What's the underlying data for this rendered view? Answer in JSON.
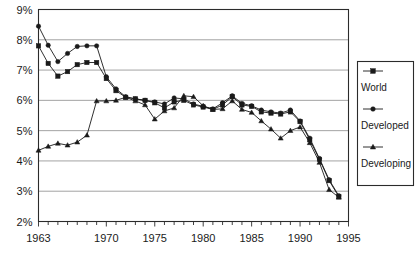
{
  "chart_data": {
    "type": "line",
    "title": "",
    "subtitle": "",
    "xlabel": "",
    "ylabel": "",
    "xlim": [
      1963,
      1995
    ],
    "ylim": [
      2,
      9
    ],
    "ytick_labels": [
      "2%",
      "3%",
      "4%",
      "5%",
      "6%",
      "7%",
      "8%",
      "9%"
    ],
    "ytick_values": [
      2,
      3,
      4,
      5,
      6,
      7,
      8,
      9
    ],
    "xtick_labels": [
      "1963",
      "1970",
      "1975",
      "1980",
      "1985",
      "1990",
      "1995"
    ],
    "xtick_values": [
      1963,
      1970,
      1975,
      1980,
      1985,
      1990,
      1995
    ],
    "grid": true,
    "legend_position": "right",
    "x": [
      1963,
      1964,
      1965,
      1966,
      1967,
      1968,
      1969,
      1970,
      1971,
      1972,
      1973,
      1974,
      1975,
      1976,
      1977,
      1978,
      1979,
      1980,
      1981,
      1982,
      1983,
      1984,
      1985,
      1986,
      1987,
      1988,
      1989,
      1990,
      1991,
      1992,
      1993,
      1994
    ],
    "series": [
      {
        "name": "World",
        "marker": "square",
        "values": [
          7.8,
          7.22,
          6.8,
          6.95,
          7.18,
          7.25,
          7.25,
          6.72,
          6.32,
          6.1,
          6.05,
          6.0,
          5.92,
          5.75,
          5.95,
          6.0,
          5.85,
          5.78,
          5.7,
          5.85,
          6.12,
          5.85,
          5.8,
          5.62,
          5.58,
          5.55,
          5.62,
          5.3,
          4.7,
          4.05,
          3.35,
          2.82
        ]
      },
      {
        "name": "Developed",
        "marker": "circle",
        "values": [
          8.45,
          7.82,
          7.28,
          7.55,
          7.78,
          7.8,
          7.8,
          6.78,
          6.38,
          6.12,
          6.05,
          6.0,
          5.95,
          5.88,
          6.08,
          6.05,
          5.88,
          5.8,
          5.72,
          5.92,
          6.15,
          5.9,
          5.82,
          5.68,
          5.62,
          5.58,
          5.68,
          5.32,
          4.75,
          4.08,
          3.38,
          2.85
        ]
      },
      {
        "name": "Developing",
        "marker": "triangle",
        "values": [
          4.35,
          4.48,
          4.58,
          4.52,
          4.62,
          4.85,
          5.98,
          5.98,
          6.0,
          6.1,
          5.98,
          5.85,
          5.38,
          5.65,
          5.75,
          6.15,
          6.12,
          5.82,
          5.7,
          5.72,
          5.98,
          5.7,
          5.6,
          5.32,
          5.05,
          4.75,
          5.0,
          5.12,
          4.6,
          3.95,
          3.05,
          2.8
        ]
      }
    ]
  },
  "legend": {
    "items": [
      {
        "label": "World",
        "marker": "square"
      },
      {
        "label": "Developed",
        "marker": "circle"
      },
      {
        "label": "Developing",
        "marker": "triangle"
      }
    ]
  }
}
